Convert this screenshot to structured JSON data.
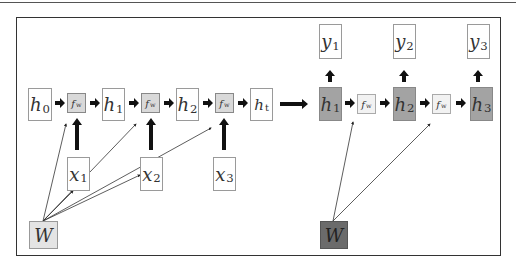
{
  "diagram": {
    "left_panel": {
      "hidden_states": [
        {
          "var": "h",
          "sub": "0"
        },
        {
          "var": "h",
          "sub": "1"
        },
        {
          "var": "h",
          "sub": "2"
        },
        {
          "var": "h",
          "sub": "t"
        }
      ],
      "functions": [
        {
          "var": "f",
          "sub": "w"
        },
        {
          "var": "f",
          "sub": "w"
        },
        {
          "var": "f",
          "sub": "w"
        }
      ],
      "inputs": [
        {
          "var": "x",
          "sub": "1"
        },
        {
          "var": "x",
          "sub": "2"
        },
        {
          "var": "x",
          "sub": "3"
        }
      ],
      "weight": {
        "var": "W"
      }
    },
    "right_panel": {
      "hidden_states": [
        {
          "var": "h",
          "sub": "1"
        },
        {
          "var": "h",
          "sub": "2"
        },
        {
          "var": "h",
          "sub": "3"
        }
      ],
      "functions": [
        {
          "var": "f",
          "sub": "w"
        },
        {
          "var": "f",
          "sub": "w"
        }
      ],
      "outputs": [
        {
          "var": "y",
          "sub": "1"
        },
        {
          "var": "y",
          "sub": "2"
        },
        {
          "var": "y",
          "sub": "3"
        }
      ],
      "weight": {
        "var": "W"
      }
    },
    "colors": {
      "fw_left": "#d9d9d9",
      "fw_right": "#f2f2f2",
      "hidden_dark": "#a3a3a3",
      "weight_light": "#e4e4e4",
      "weight_dark": "#6b6b6b"
    }
  }
}
